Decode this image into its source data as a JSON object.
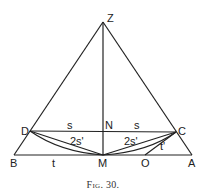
{
  "figure": {
    "caption": "Fig. 30.",
    "points": {
      "Z": {
        "label": "Z",
        "x": 103,
        "y": 22
      },
      "D": {
        "label": "D",
        "x": 30,
        "y": 131
      },
      "C": {
        "label": "C",
        "x": 176,
        "y": 132
      },
      "N": {
        "label": "N",
        "x": 103,
        "y": 131
      },
      "B": {
        "label": "B",
        "x": 14,
        "y": 155
      },
      "M": {
        "label": "M",
        "x": 103,
        "y": 155
      },
      "O": {
        "label": "O",
        "x": 145,
        "y": 155
      },
      "A": {
        "label": "A",
        "x": 192,
        "y": 155
      }
    },
    "segment_labels": {
      "DN": "s",
      "NC": "s",
      "DM_chord": "2s'",
      "MC_chord": "2s'",
      "BM": "t",
      "OC": "t'"
    }
  }
}
